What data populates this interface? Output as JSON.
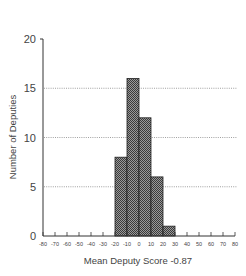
{
  "chart_data": {
    "type": "bar",
    "title": "",
    "xlabel": "Mean Deputy Score -0.87",
    "ylabel": "Number of Deputies",
    "bins": [
      {
        "from": -20,
        "to": -10,
        "value": 8
      },
      {
        "from": -10,
        "to": 0,
        "value": 16
      },
      {
        "from": 0,
        "to": 10,
        "value": 12
      },
      {
        "from": 10,
        "to": 20,
        "value": 6
      },
      {
        "from": 20,
        "to": 30,
        "value": 1
      }
    ],
    "categories": [
      "-20 to -10",
      "-10 to 0",
      "0 to 10",
      "10 to 20",
      "20 to 30"
    ],
    "values": [
      8,
      16,
      12,
      6,
      1
    ],
    "xlim": [
      -80,
      80
    ],
    "ylim": [
      0,
      20
    ],
    "xticks": [
      -80,
      -70,
      -60,
      -50,
      -40,
      -30,
      -20,
      -10,
      0,
      10,
      20,
      30,
      40,
      50,
      60,
      70,
      80
    ],
    "yticks": [
      0,
      5,
      10,
      15,
      20
    ],
    "grid": {
      "horizontal_dotted_at": [
        5,
        10,
        15
      ]
    },
    "legend": null,
    "bar_fill": "crosshatch-dark-gray"
  },
  "labels": {
    "xlabel": "Mean Deputy Score -0.87",
    "ylabel": "Number of Deputies"
  }
}
